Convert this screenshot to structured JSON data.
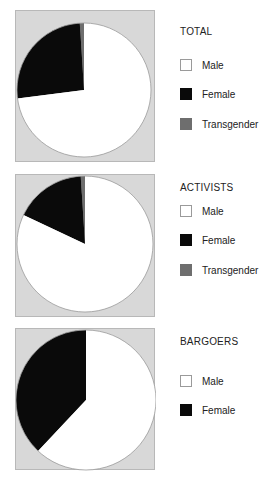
{
  "chart_data": [
    {
      "type": "pie",
      "title": "TOTAL",
      "categories": [
        "Male",
        "Female",
        "Transgender"
      ],
      "values": [
        73,
        26,
        1
      ],
      "colors": [
        "#ffffff",
        "#0a0a0a",
        "#6e6e6e"
      ],
      "legend_position": "right"
    },
    {
      "type": "pie",
      "title": "ACTIVISTS",
      "categories": [
        "Male",
        "Female",
        "Transgender"
      ],
      "values": [
        82,
        17,
        1
      ],
      "colors": [
        "#ffffff",
        "#0a0a0a",
        "#6e6e6e"
      ],
      "legend_position": "right"
    },
    {
      "type": "pie",
      "title": "BARGOERS",
      "categories": [
        "Male",
        "Female"
      ],
      "values": [
        62,
        38
      ],
      "colors": [
        "#ffffff",
        "#0a0a0a"
      ],
      "legend_position": "right"
    }
  ],
  "panels": [
    {
      "title": "TOTAL",
      "legend": [
        "Male",
        "Female",
        "Transgender"
      ]
    },
    {
      "title": "ACTIVISTS",
      "legend": [
        "Male",
        "Female",
        "Transgender"
      ]
    },
    {
      "title": "BARGOERS",
      "legend": [
        "Male",
        "Female"
      ]
    }
  ],
  "colors": {
    "panel_bg": "#d8d8d8",
    "male": "#ffffff",
    "female": "#0a0a0a",
    "transgender": "#6e6e6e"
  }
}
